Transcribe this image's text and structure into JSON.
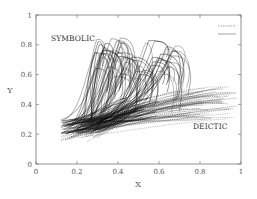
{
  "chart_data": {
    "type": "line",
    "title": "",
    "xlabel": "X",
    "ylabel": "Y",
    "xlim": [
      0,
      1
    ],
    "ylim": [
      0,
      1
    ],
    "xticks": [
      "0",
      "0.2",
      "0.4",
      "0.6",
      "0.8",
      "1"
    ],
    "yticks": [
      "0",
      "0.2",
      "0.4",
      "0.6",
      "0.8",
      "1"
    ],
    "grid": false,
    "legend_position": "top-right",
    "legend": [
      {
        "name": "",
        "style": "dashed",
        "color": "#555555"
      },
      {
        "name": "",
        "style": "solid",
        "color": "#555555"
      }
    ],
    "annotations": [
      {
        "text": "SYMBOLIC",
        "x": 0.1,
        "y": 0.8
      },
      {
        "text": "DEICTIC",
        "x": 0.79,
        "y": 0.25
      }
    ],
    "series": [
      {
        "name": "SYMBOLIC",
        "style": "solid",
        "description": "bundle of hand trajectories starting near x 0.12-0.32, y 0.2-0.3, rising steeply and hooking back with peaks around y 0.55-0.85",
        "start_x_range": [
          0.12,
          0.32
        ],
        "start_y_range": [
          0.2,
          0.3
        ],
        "peak_x_range": [
          0.28,
          0.68
        ],
        "peak_y_range": [
          0.55,
          0.85
        ],
        "count": 60
      },
      {
        "name": "DEICTIC",
        "style": "dashed",
        "description": "bundle of hand trajectories starting near x 0.12-0.3, y 0.14-0.3, extending right and slightly upward to end near x 0.7-0.98, y 0.3-0.52",
        "start_x_range": [
          0.12,
          0.3
        ],
        "start_y_range": [
          0.14,
          0.3
        ],
        "end_x_range": [
          0.7,
          0.98
        ],
        "end_y_range": [
          0.3,
          0.52
        ],
        "count": 60
      }
    ]
  }
}
